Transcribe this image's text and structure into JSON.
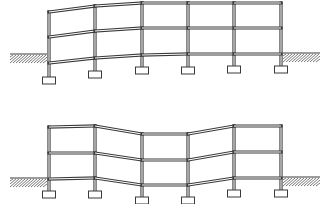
{
  "diagram": {
    "colors": {
      "line": "#3a3a3a",
      "background": "#ffffff",
      "hatch": "#555555"
    },
    "footing_size": {
      "w": 13,
      "h": 7
    },
    "frames": [
      {
        "id": "frame-edge-settlement",
        "columns_x": [
          49,
          95,
          142,
          188,
          234,
          281
        ],
        "levels_y": [
          [
            12,
            6,
            3,
            3,
            3,
            3
          ],
          [
            37,
            31,
            28,
            28,
            28,
            28
          ],
          [
            63,
            58,
            55,
            54,
            54,
            54
          ]
        ],
        "footing_top_y": [
          77,
          71,
          67,
          67,
          66,
          66
        ],
        "ground": [
          {
            "side": "left",
            "x1": 10,
            "x2": 47,
            "y": 54,
            "depth": 9
          },
          {
            "side": "right",
            "x1": 283,
            "x2": 320,
            "y": 53,
            "depth": 9
          }
        ]
      },
      {
        "id": "frame-center-settlement",
        "columns_x": [
          49,
          95,
          142,
          188,
          234,
          281
        ],
        "levels_y": [
          [
            127,
            126,
            134,
            134,
            126,
            126
          ],
          [
            153,
            153,
            160,
            160,
            152,
            152
          ],
          [
            179,
            178,
            185,
            185,
            178,
            178
          ]
        ],
        "footing_top_y": [
          191,
          191,
          197,
          197,
          190,
          190
        ],
        "ground": [
          {
            "side": "left",
            "x1": 10,
            "x2": 47,
            "y": 178,
            "depth": 9
          },
          {
            "side": "right",
            "x1": 283,
            "x2": 320,
            "y": 177,
            "depth": 9
          }
        ]
      }
    ]
  }
}
